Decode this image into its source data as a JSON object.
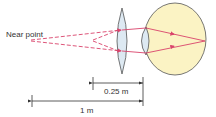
{
  "labels": {
    "near_point": "Near point",
    "dist_small": "0.25 m",
    "dist_large": "1 m"
  },
  "colors": {
    "ray": "#d9436b",
    "lens_fill": "#dde9f2",
    "lens_stroke": "#555555",
    "eye_fill": "#fbf3c4",
    "eye_stroke": "#555555",
    "dim_line": "#333333"
  }
}
